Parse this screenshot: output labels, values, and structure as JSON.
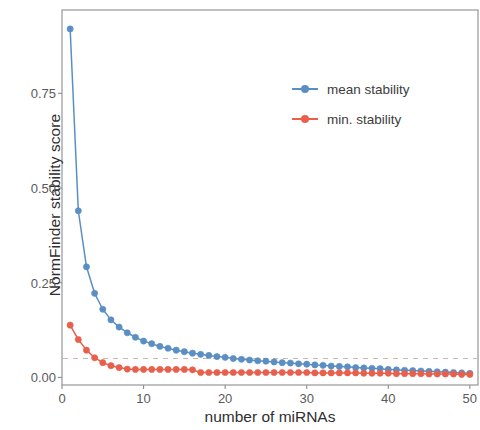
{
  "chart_data": {
    "type": "line",
    "title": "",
    "xlabel": "number of miRNAs",
    "ylabel": "NormFinder stability score",
    "xlim": [
      0,
      51
    ],
    "ylim": [
      -0.02,
      0.97
    ],
    "xticks": [
      0,
      10,
      20,
      30,
      40,
      50
    ],
    "xtick_labels": [
      "0",
      "10",
      "20",
      "30",
      "40",
      "50"
    ],
    "yticks": [
      0.0,
      0.25,
      0.5,
      0.75
    ],
    "ytick_labels": [
      "0.00",
      "0.25",
      "0.50",
      "0.75"
    ],
    "grid": false,
    "legend_position": "top-right",
    "panel_border": true,
    "reference_line": {
      "orientation": "horizontal",
      "value": 0.05,
      "style": "dashed",
      "color": "#c9b8b2"
    },
    "colors": {
      "mean_stability": "#5b8fc4",
      "min_stability": "#e8604c",
      "panel_border": "#8d8d8d",
      "axis_text": "#5a5a5a",
      "background": "#ffffff"
    },
    "x": [
      1,
      2,
      3,
      4,
      5,
      6,
      7,
      8,
      9,
      10,
      11,
      12,
      13,
      14,
      15,
      16,
      17,
      18,
      19,
      20,
      21,
      22,
      23,
      24,
      25,
      26,
      27,
      28,
      29,
      30,
      31,
      32,
      33,
      34,
      35,
      36,
      37,
      38,
      39,
      40,
      41,
      42,
      43,
      44,
      45,
      46,
      47,
      48,
      49,
      50
    ],
    "series": [
      {
        "name": "mean stability",
        "color": "#5b8fc4",
        "values": [
          0.92,
          0.44,
          0.292,
          0.222,
          0.18,
          0.152,
          0.133,
          0.118,
          0.106,
          0.096,
          0.089,
          0.082,
          0.077,
          0.072,
          0.068,
          0.064,
          0.061,
          0.058,
          0.055,
          0.053,
          0.05,
          0.048,
          0.046,
          0.044,
          0.043,
          0.041,
          0.039,
          0.038,
          0.036,
          0.035,
          0.033,
          0.032,
          0.03,
          0.029,
          0.028,
          0.026,
          0.025,
          0.024,
          0.023,
          0.021,
          0.02,
          0.019,
          0.018,
          0.017,
          0.016,
          0.015,
          0.014,
          0.013,
          0.012,
          0.011
        ]
      },
      {
        "name": "min. stability",
        "color": "#e8604c",
        "values": [
          0.138,
          0.1,
          0.072,
          0.052,
          0.039,
          0.031,
          0.026,
          0.022,
          0.021,
          0.021,
          0.021,
          0.021,
          0.021,
          0.021,
          0.021,
          0.02,
          0.013,
          0.013,
          0.013,
          0.013,
          0.013,
          0.013,
          0.013,
          0.013,
          0.013,
          0.013,
          0.013,
          0.013,
          0.013,
          0.013,
          0.012,
          0.012,
          0.012,
          0.012,
          0.012,
          0.012,
          0.011,
          0.011,
          0.011,
          0.011,
          0.01,
          0.01,
          0.01,
          0.01,
          0.009,
          0.009,
          0.009,
          0.009,
          0.008,
          0.008
        ]
      }
    ]
  },
  "legend": {
    "items": [
      {
        "label": "mean stability",
        "color": "#5b8fc4"
      },
      {
        "label": "min. stability",
        "color": "#e8604c"
      }
    ]
  }
}
